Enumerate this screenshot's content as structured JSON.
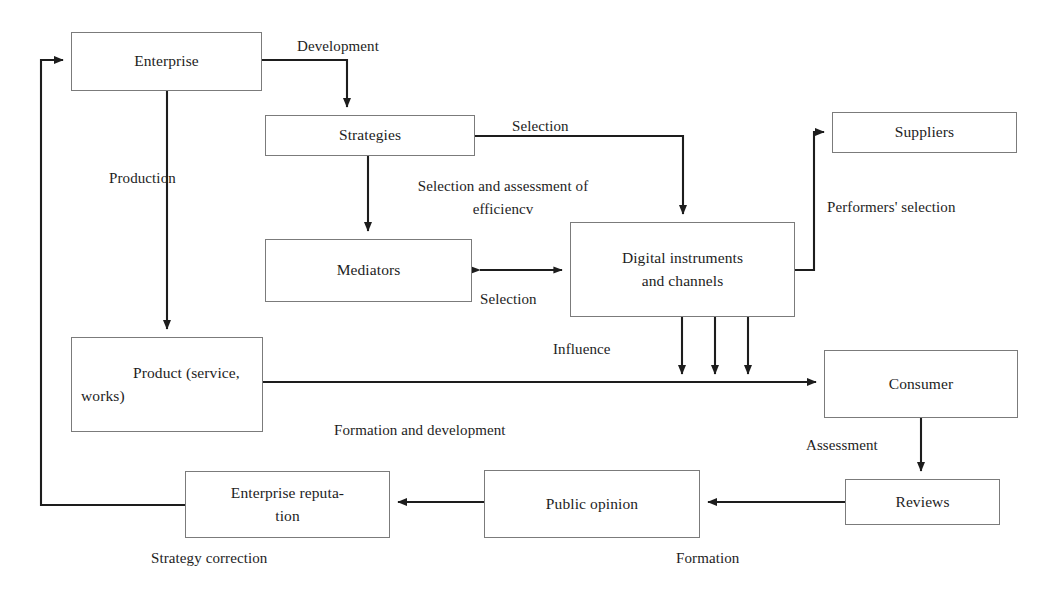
{
  "diagram": {
    "background": "#ffffff",
    "line_color": "#1d1d1d",
    "box_border_color": "#7b7b7b",
    "nodes": [
      {
        "id": "enterprise",
        "label": "Enterprise"
      },
      {
        "id": "strategies",
        "label": "Strategies"
      },
      {
        "id": "mediators",
        "label": "Mediators"
      },
      {
        "id": "digital_instruments",
        "label": "Digital instruments\nand channels"
      },
      {
        "id": "suppliers",
        "label": "Suppliers"
      },
      {
        "id": "product",
        "label": "Product   (service,\nworks)"
      },
      {
        "id": "consumer",
        "label": "Consumer"
      },
      {
        "id": "reviews",
        "label": "Reviews"
      },
      {
        "id": "public_opinion",
        "label": "Public opinion"
      },
      {
        "id": "enterprise_reputation",
        "label": "Enterprise reputa-\ntion"
      }
    ],
    "edge_labels": [
      {
        "id": "development",
        "text": "Development"
      },
      {
        "id": "production",
        "text": "Production"
      },
      {
        "id": "selection_strategies",
        "text": "Selection"
      },
      {
        "id": "selection_assessment",
        "text": "Selection and assessment of\nefficiencv"
      },
      {
        "id": "selection_mediators",
        "text": "Selection"
      },
      {
        "id": "performers_selection",
        "text": "Performers' selection"
      },
      {
        "id": "influence",
        "text": "Influence"
      },
      {
        "id": "formation_development",
        "text": "Formation and development"
      },
      {
        "id": "assessment",
        "text": "Assessment"
      },
      {
        "id": "formation",
        "text": "Formation"
      },
      {
        "id": "strategy_correction",
        "text": "Strategy correction"
      }
    ]
  }
}
